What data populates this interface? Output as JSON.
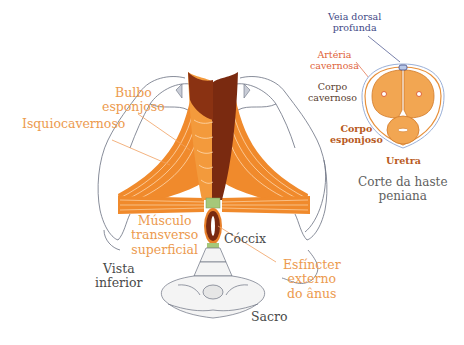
{
  "figure": {
    "main_view": {
      "caption": "Vista\ninferior",
      "labels": {
        "bulbo_esponjoso": "Bulbo\nesponjoso",
        "isquiocavernoso": "Isquiocavernoso",
        "musculo_transverso": "Músculo\ntransverso\nsuperficial",
        "coccix": "Cóccix",
        "esfincter": "Esfíncter\nexterno\ndo ânus",
        "sacro": "Sacro"
      }
    },
    "cross_section": {
      "caption": "Corte da haste\npeniana",
      "labels": {
        "veia_dorsal": "Veia dorsal\nprofunda",
        "arteria": "Artéria\ncavernosa",
        "corpo_cavernoso": "Corpo\ncavernoso",
        "corpo_esponjoso": "Corpo\nesponjoso",
        "uretra": "Uretra"
      }
    },
    "colors": {
      "muscle_orange": "#f08a2c",
      "muscle_dark": "#7a2a10",
      "label_orange": "#ec9a4e",
      "outline_gray": "#6a7080",
      "tissue_orange": "#f2a652"
    }
  }
}
